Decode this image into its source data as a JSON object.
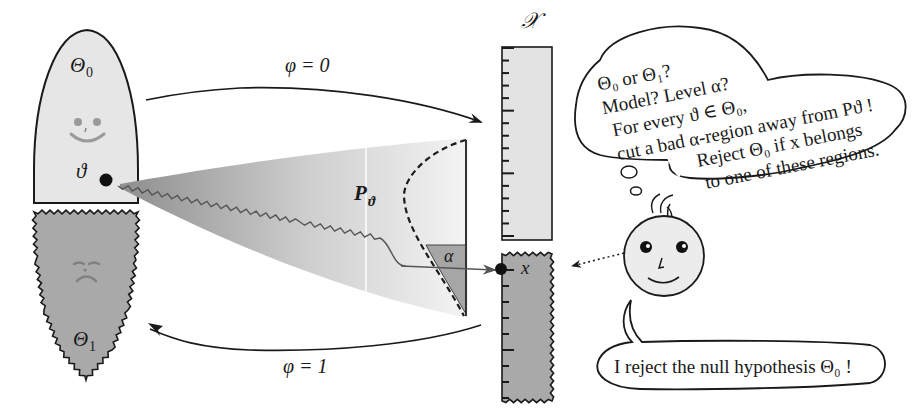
{
  "diagram": {
    "colors": {
      "theta0_fill": "#e6e6e6",
      "theta1_fill": "#a9a9a9",
      "density_dark": "#9a9a9a",
      "density_light": "#f2f2f2",
      "alpha_region": "#a6a6a6",
      "ruler_top": "#e3e3e3",
      "ruler_bottom": "#a9a9a9",
      "face_fill": "#ececec",
      "stroke": "#1a1a1a"
    }
  },
  "parameter_space": {
    "theta0_label": "Θ",
    "theta0_sub": "0",
    "theta1_label": "Θ",
    "theta1_sub": "1",
    "theta_point_label": "ϑ",
    "theta0_face": "happy",
    "theta1_face": "sad"
  },
  "arrows": {
    "phi0_label": "φ = 0",
    "phi1_label": "φ = 1"
  },
  "distribution": {
    "label": "P",
    "label_sub": "ϑ",
    "alpha_label": "α"
  },
  "sample_space": {
    "label": "𝒳",
    "observation_label": "x",
    "tick_count_upper": 16,
    "tick_count_lower": 9
  },
  "thought_bubble": {
    "lines": [
      "Θ₀ or Θ₁?",
      "Model?  Level α?",
      "For every ϑ ∈ Θ₀,",
      "cut a bad α-region away from Pϑ !",
      "Reject Θ₀ if x belongs",
      "to one of these regions."
    ]
  },
  "speech_bubble": {
    "text": "I reject the null hypothesis Θ₀ !"
  }
}
